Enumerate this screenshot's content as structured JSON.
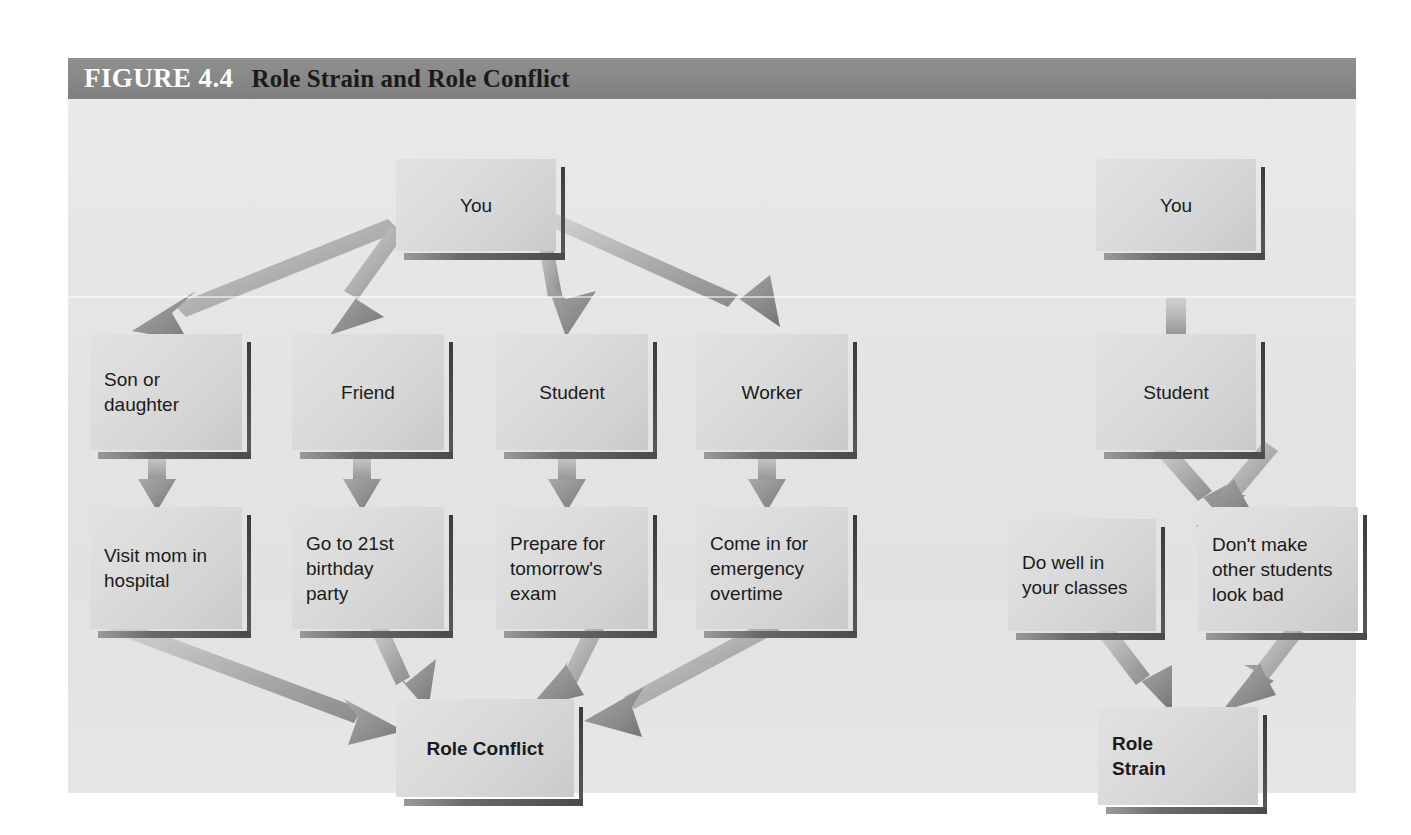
{
  "figure": {
    "number_label": "FIGURE 4.4",
    "title": "Role Strain and Role Conflict"
  },
  "diagram": {
    "type": "flowchart",
    "panels": [
      {
        "name": "role-conflict-panel",
        "outcome": "Role Conflict",
        "root": "You",
        "roles": [
          "Son or daughter",
          "Friend",
          "Student",
          "Worker"
        ],
        "obligations": [
          "Visit mom in\nhospital",
          "Go to 21st\nbirthday\nparty",
          "Prepare for\ntomorrow's\nexam",
          "Come in for\nemergency\novertime"
        ]
      },
      {
        "name": "role-strain-panel",
        "outcome": "Role\nStrain",
        "root": "You",
        "roles": [
          "Student"
        ],
        "obligations": [
          "Do well in\nyour classes",
          "Don't make\nother students\nlook bad"
        ]
      }
    ],
    "nodes": {
      "you_left": "You",
      "son_or_daughter": "Son or\ndaughter",
      "friend": "Friend",
      "student_left": "Student",
      "worker": "Worker",
      "visit_mom": "Visit mom in\nhospital",
      "birthday": "Go to 21st\nbirthday\nparty",
      "exam": "Prepare for\ntomorrow's\nexam",
      "overtime": "Come in for\nemergency\novertime",
      "role_conflict": "Role Conflict",
      "you_right": "You",
      "student_right": "Student",
      "do_well": "Do well in\nyour classes",
      "dont_make": "Don't make\nother students\nlook bad",
      "role_strain": "Role\nStrain"
    }
  },
  "colors": {
    "header_bar": "#878787",
    "figure_background": "#e4e4e4",
    "box_fill": "#dcdcdc",
    "box_shadow": "#4a4a4a",
    "arrow_fill": "#9e9e9e",
    "text": "#1b1b1b",
    "figure_number_text": "#ffffff",
    "figure_title_text": "#1a1a1a"
  }
}
